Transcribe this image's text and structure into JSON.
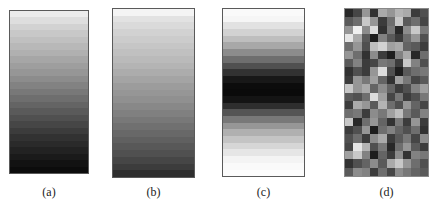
{
  "figure": {
    "panels": [
      {
        "id": "a",
        "caption": "(a)",
        "type": "vertical-gradient-bands",
        "description": "light to dark, top to bottom",
        "box": {
          "x": 9,
          "y": 10,
          "w": 80,
          "h": 164
        },
        "bands": [
          236,
          222,
          210,
          200,
          192,
          184,
          176,
          166,
          158,
          150,
          140,
          130,
          120,
          110,
          100,
          90,
          80,
          70,
          60,
          50,
          42,
          34,
          26,
          18,
          12
        ]
      },
      {
        "id": "b",
        "caption": "(b)",
        "type": "vertical-gradient-bands",
        "description": "light to dark, top to bottom (softer)",
        "box": {
          "x": 112,
          "y": 8,
          "w": 83,
          "h": 170
        },
        "bands": [
          244,
          226,
          218,
          210,
          204,
          198,
          192,
          186,
          180,
          172,
          164,
          156,
          150,
          144,
          136,
          128,
          120,
          112,
          104,
          96,
          88,
          80,
          70,
          60,
          46
        ]
      },
      {
        "id": "c",
        "caption": "(c)",
        "type": "vertical-gradient-bands",
        "description": "light at top and bottom, dark in the middle",
        "box": {
          "x": 222,
          "y": 8,
          "w": 83,
          "h": 169
        },
        "bands": [
          250,
          246,
          226,
          210,
          190,
          168,
          140,
          110,
          80,
          50,
          24,
          12,
          10,
          20,
          46,
          84,
          120,
          150,
          176,
          196,
          214,
          230,
          244,
          250,
          252
        ]
      },
      {
        "id": "d",
        "caption": "(d)",
        "type": "random-grayscale-grid",
        "description": "random grayscale checker pattern",
        "box": {
          "x": 344,
          "y": 8,
          "w": 85,
          "h": 169
        },
        "cols": 10,
        "rows": 20,
        "cells": [
          [
            40,
            70,
            150,
            50,
            170,
            150,
            180,
            170,
            60,
            80
          ],
          [
            90,
            110,
            200,
            150,
            60,
            110,
            200,
            90,
            110,
            70
          ],
          [
            150,
            240,
            140,
            220,
            50,
            120,
            40,
            140,
            200,
            120
          ],
          [
            230,
            170,
            90,
            30,
            130,
            90,
            60,
            110,
            150,
            80
          ],
          [
            110,
            150,
            80,
            190,
            210,
            160,
            170,
            100,
            90,
            60
          ],
          [
            150,
            110,
            50,
            140,
            60,
            30,
            130,
            170,
            40,
            110
          ],
          [
            90,
            130,
            60,
            70,
            120,
            110,
            60,
            200,
            130,
            80
          ],
          [
            50,
            80,
            60,
            150,
            220,
            80,
            30,
            90,
            110,
            120
          ],
          [
            60,
            150,
            120,
            160,
            100,
            50,
            160,
            120,
            70,
            90
          ],
          [
            200,
            150,
            170,
            100,
            140,
            100,
            60,
            80,
            130,
            160
          ],
          [
            90,
            80,
            110,
            220,
            160,
            70,
            120,
            60,
            80,
            120
          ],
          [
            60,
            170,
            150,
            90,
            180,
            110,
            80,
            150,
            100,
            70
          ],
          [
            110,
            120,
            60,
            140,
            120,
            160,
            190,
            120,
            90,
            130
          ],
          [
            200,
            40,
            110,
            150,
            100,
            50,
            120,
            60,
            150,
            60
          ],
          [
            60,
            80,
            150,
            30,
            110,
            130,
            100,
            80,
            110,
            50
          ],
          [
            80,
            110,
            60,
            140,
            170,
            60,
            90,
            120,
            70,
            140
          ],
          [
            70,
            230,
            180,
            80,
            120,
            40,
            110,
            150,
            90,
            60
          ],
          [
            160,
            200,
            130,
            30,
            100,
            60,
            140,
            50,
            130,
            120
          ],
          [
            50,
            80,
            100,
            140,
            90,
            170,
            200,
            150,
            110,
            80
          ],
          [
            90,
            140,
            130,
            60,
            110,
            70,
            140,
            120,
            100,
            90
          ]
        ]
      }
    ],
    "captions_y": 185
  }
}
